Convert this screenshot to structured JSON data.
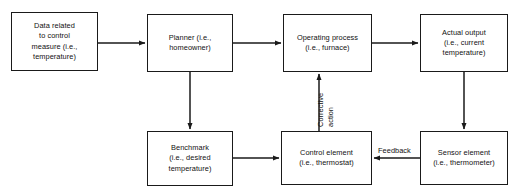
{
  "diagram": {
    "type": "flowchart",
    "background_color": "#ffffff",
    "line_color": "#1a1a1a",
    "text_color": "#111111",
    "nodes": [
      {
        "id": "data",
        "label": "Data related\nto control\nmeasure (i.e.,\ntemperature)",
        "x": 11,
        "y": 12,
        "w": 87,
        "h": 59
      },
      {
        "id": "planner",
        "label": "Planner (i.e.,\nhomeowner)",
        "x": 147,
        "y": 14,
        "w": 86,
        "h": 58
      },
      {
        "id": "operating",
        "label": "Operating process\n(i.e., furnace)",
        "x": 283,
        "y": 14,
        "w": 89,
        "h": 58
      },
      {
        "id": "output",
        "label": "Actual output\n(i.e., current\ntemperature)",
        "x": 420,
        "y": 14,
        "w": 88,
        "h": 58
      },
      {
        "id": "benchmark",
        "label": "Benchmark\n(i.e., desired\ntemperature)",
        "x": 147,
        "y": 131,
        "w": 86,
        "h": 55
      },
      {
        "id": "control",
        "label": "Control element\n(i.e., thermostat)",
        "x": 281,
        "y": 131,
        "w": 91,
        "h": 54
      },
      {
        "id": "sensor",
        "label": "Sensor element\n(i.e., thermometer)",
        "x": 420,
        "y": 131,
        "w": 88,
        "h": 54
      }
    ],
    "edge_labels": {
      "corrective": "Corrective",
      "action": "action",
      "feedback": "Feedback"
    },
    "edges": [
      {
        "from": "data",
        "to": "planner",
        "label": ""
      },
      {
        "from": "planner",
        "to": "operating",
        "label": ""
      },
      {
        "from": "operating",
        "to": "output",
        "label": ""
      },
      {
        "from": "planner",
        "to": "benchmark",
        "label": ""
      },
      {
        "from": "output",
        "to": "sensor",
        "label": ""
      },
      {
        "from": "sensor",
        "to": "control",
        "label": "Feedback"
      },
      {
        "from": "benchmark",
        "to": "control",
        "label": ""
      },
      {
        "from": "control",
        "to": "operating",
        "label": "Corrective action"
      }
    ]
  }
}
